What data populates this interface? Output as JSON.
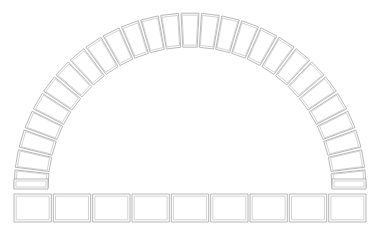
{
  "drawing": {
    "title": "Semicircular Voussoir Arch",
    "type": "line-drawing",
    "background_color": "#ffffff",
    "stroke_color": "#9a9a9a",
    "inner_stroke_color": "#b5b5b5",
    "fill_color": "#ffffff",
    "stroke_width": 0.7,
    "inner_stroke_width": 0.6,
    "canvas": {
      "width": 380,
      "height": 229
    }
  },
  "arch": {
    "name": "arch-ring",
    "shape": "semicircle",
    "center_x": 190,
    "center_y": 189,
    "inner_radius": 142,
    "outer_radius": 176,
    "start_angle_deg": 180,
    "end_angle_deg": 0,
    "voussoir_count": 27,
    "gap_deg": 0.85,
    "inner_inset": 2.2,
    "keystone_index": 13
  },
  "springers": {
    "name": "springer-course",
    "count": 2,
    "height": 10,
    "left": {
      "x": 14,
      "y": 179,
      "width": 34,
      "height": 10
    },
    "right": {
      "x": 332,
      "y": 179,
      "width": 34,
      "height": 10
    },
    "inner_inset": 2.0
  },
  "base_course": {
    "name": "base-course",
    "count": 9,
    "y": 194,
    "height": 28,
    "start_x": 14,
    "end_x": 366,
    "gap": 2.0,
    "inner_inset": 2.2,
    "blocks": [
      {
        "index": 1,
        "label": "base-block-1"
      },
      {
        "index": 2,
        "label": "base-block-2"
      },
      {
        "index": 3,
        "label": "base-block-3"
      },
      {
        "index": 4,
        "label": "base-block-4"
      },
      {
        "index": 5,
        "label": "base-block-5"
      },
      {
        "index": 6,
        "label": "base-block-6"
      },
      {
        "index": 7,
        "label": "base-block-7"
      },
      {
        "index": 8,
        "label": "base-block-8"
      },
      {
        "index": 9,
        "label": "base-block-9"
      }
    ]
  }
}
